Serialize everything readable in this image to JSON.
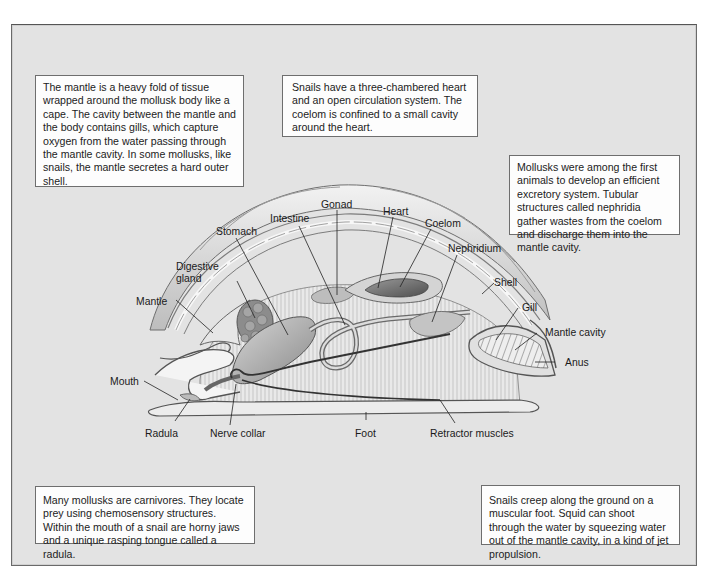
{
  "figure": {
    "background_color": "#e3e3e3",
    "box_color": "#fdfdfd",
    "border_color": "#6e6e6e"
  },
  "callouts": {
    "mantle": "The mantle is a heavy fold of tissue wrapped around the mollusk body like a cape. The cavity between the mantle and the body contains gills, which capture oxygen from the water passing through the mantle cavity. In some mollusks, like snails, the mantle secretes a hard outer shell.",
    "heart": "Snails have a three-chambered heart and an open circulation system. The coelom is confined to a small cavity around the heart.",
    "excretory": "Mollusks were among the first animals to develop an efficient excretory system. Tubular structures called nephridia gather wastes from the coelom and discharge them into the mantle cavity.",
    "carnivore": "Many mollusks are carnivores. They locate prey using chemosensory structures. Within the mouth of a snail are horny jaws and a unique rasping tongue called a radula.",
    "foot": "Snails creep along the ground on a muscular foot. Squid can shoot through the water by squeezing water out of the mantle cavity, in a kind of jet propulsion."
  },
  "labels": {
    "gonad": "Gonad",
    "heart": "Heart",
    "intestine": "Intestine",
    "coelom": "Coelom",
    "stomach": "Stomach",
    "nephridium": "Nephridium",
    "digestive_gland_1": "Digestive",
    "digestive_gland_2": "gland",
    "shell": "Shell",
    "mantle": "Mantle",
    "gill": "Gill",
    "mantle_cavity": "Mantle cavity",
    "anus": "Anus",
    "mouth": "Mouth",
    "radula": "Radula",
    "nerve_collar": "Nerve collar",
    "foot": "Foot",
    "retractor_muscles": "Retractor muscles"
  }
}
